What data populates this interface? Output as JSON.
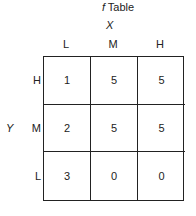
{
  "title": {
    "symbol": "f",
    "text": "Table"
  },
  "x_axis": {
    "label": "X",
    "columns": [
      "L",
      "M",
      "H"
    ]
  },
  "y_axis": {
    "label": "Y",
    "rows": [
      "H",
      "M",
      "L"
    ]
  },
  "table": {
    "rows": [
      {
        "label": "H",
        "values": [
          "1",
          "5",
          "5"
        ]
      },
      {
        "label": "M",
        "values": [
          "2",
          "5",
          "5"
        ]
      },
      {
        "label": "L",
        "values": [
          "3",
          "0",
          "0"
        ]
      }
    ]
  }
}
